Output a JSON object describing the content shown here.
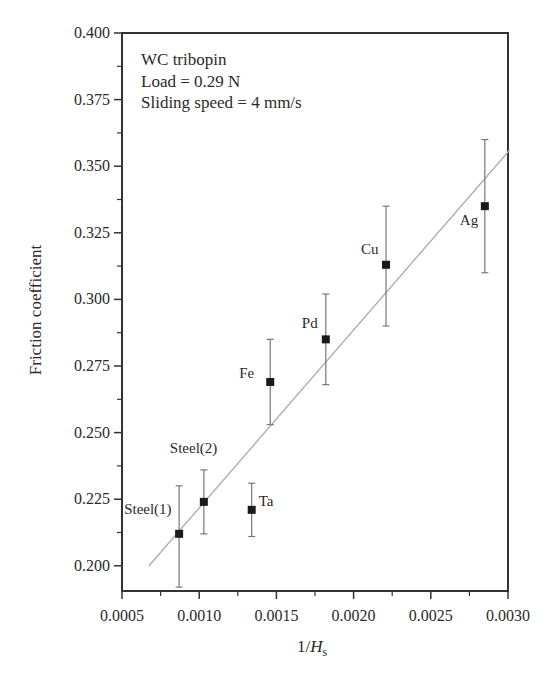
{
  "chart_data": {
    "type": "scatter",
    "title": "",
    "xlabel": "1/H",
    "xlabel_subscript": "s",
    "ylabel": "Friction coefficient",
    "xlim": [
      0.0005,
      0.003
    ],
    "ylim": [
      0.19,
      0.4
    ],
    "x_ticks": [
      0.0005,
      0.001,
      0.0015,
      0.002,
      0.0025,
      0.003
    ],
    "x_tick_labels": [
      "0.0005",
      "0.0010",
      "0.0015",
      "0.0020",
      "0.0025",
      "0.0030"
    ],
    "y_ticks": [
      0.2,
      0.225,
      0.25,
      0.275,
      0.3,
      0.325,
      0.35,
      0.375,
      0.4
    ],
    "y_tick_labels": [
      "0.200",
      "0.225",
      "0.250",
      "0.275",
      "0.300",
      "0.325",
      "0.350",
      "0.375",
      "0.400"
    ],
    "grid": false,
    "legend": null,
    "annotations": [
      "WC tribopin",
      "Load = 0.29 N",
      "Sliding speed = 4 mm/s"
    ],
    "points": [
      {
        "label": "Steel(1)",
        "x": 0.00087,
        "y": 0.212,
        "err_low": 0.192,
        "err_high": 0.23
      },
      {
        "label": "Steel(2)",
        "x": 0.00103,
        "y": 0.224,
        "err_low": 0.212,
        "err_high": 0.236
      },
      {
        "label": "Ta",
        "x": 0.00134,
        "y": 0.221,
        "err_low": 0.211,
        "err_high": 0.231
      },
      {
        "label": "Fe",
        "x": 0.00146,
        "y": 0.269,
        "err_low": 0.253,
        "err_high": 0.285
      },
      {
        "label": "Pd",
        "x": 0.00182,
        "y": 0.285,
        "err_low": 0.268,
        "err_high": 0.302
      },
      {
        "label": "Cu",
        "x": 0.00221,
        "y": 0.313,
        "err_low": 0.29,
        "err_high": 0.335
      },
      {
        "label": "Ag",
        "x": 0.00285,
        "y": 0.335,
        "err_low": 0.31,
        "err_high": 0.36
      }
    ],
    "fit_line": {
      "x": [
        0.000675,
        0.00301
      ],
      "y": [
        0.2,
        0.356
      ]
    }
  },
  "labels": {
    "annot_line1": "WC tribopin",
    "annot_line2": "Load = 0.29 N",
    "annot_line3": "Sliding speed = 4 mm/s",
    "ylabel": "Friction coefficient",
    "xlabel_main": "1/H",
    "xlabel_sub": "s"
  }
}
